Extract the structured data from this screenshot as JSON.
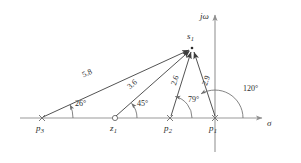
{
  "figure": {
    "axes": {
      "real": {
        "label": "σ",
        "name": "sigma"
      },
      "imag": {
        "label": "jω",
        "name": "j-omega"
      }
    },
    "test_point": {
      "label": "s",
      "sub": "1"
    },
    "points": [
      {
        "id": "p3",
        "label": "p",
        "sub": "3",
        "kind": "pole",
        "marker": "cross"
      },
      {
        "id": "z1",
        "label": "z",
        "sub": "1",
        "kind": "zero",
        "marker": "circle"
      },
      {
        "id": "p2",
        "label": "p",
        "sub": "2",
        "kind": "pole",
        "marker": "cross"
      },
      {
        "id": "p1",
        "label": "p",
        "sub": "1",
        "kind": "pole",
        "marker": "cross"
      }
    ],
    "magnitudes": [
      {
        "id": "mag-p3",
        "value": "5.8",
        "from": "p3"
      },
      {
        "id": "mag-z1",
        "value": "3.6",
        "from": "z1"
      },
      {
        "id": "mag-p2",
        "value": "2.6",
        "from": "p2"
      },
      {
        "id": "mag-p1",
        "value": "2.9",
        "from": "p1"
      }
    ],
    "angles": [
      {
        "id": "ang-p3",
        "value": "26°",
        "at": "p3"
      },
      {
        "id": "ang-z1",
        "value": "45°",
        "at": "z1"
      },
      {
        "id": "ang-p2",
        "value": "79°",
        "at": "p2"
      },
      {
        "id": "ang-p1",
        "value": "120°",
        "at": "p1"
      }
    ],
    "colors": {
      "background": "#ffffff",
      "axis": "#9a9a9a",
      "vector": "#4a4a4a",
      "arc": "#6e6e6e",
      "text": "#2b2b2b"
    }
  }
}
